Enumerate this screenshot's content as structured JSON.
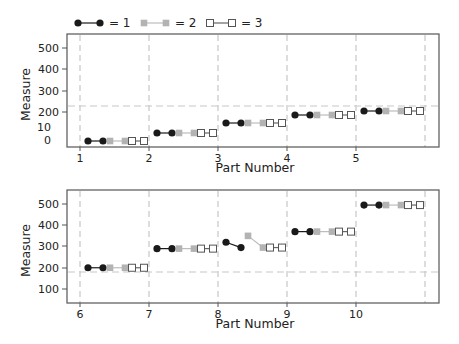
{
  "chart_data": {
    "type": "line",
    "title": "",
    "legend": {
      "position": "top-left",
      "entries": [
        {
          "label": "= 1",
          "marker": "filled-circle",
          "color": "#1a1a1a"
        },
        {
          "label": "= 2",
          "marker": "filled-square",
          "color": "#b3b3b3"
        },
        {
          "label": "= 3",
          "marker": "open-square",
          "color": "#555555"
        }
      ]
    },
    "panels": [
      {
        "xlabel": "Part Number",
        "ylabel": "Measure",
        "x_ticks": [
          "1",
          "2",
          "3",
          "4",
          "5"
        ],
        "y_ticks": [
          "0",
          "10",
          "200",
          "300",
          "400",
          "500"
        ],
        "reference_line": 225,
        "grid": "vertical dashed",
        "parts": [
          {
            "part": "1",
            "op1": [
              0,
              0
            ],
            "op2": [
              0,
              0
            ],
            "op3": [
              0,
              0
            ]
          },
          {
            "part": "2",
            "op1": [
              40,
              40
            ],
            "op2": [
              40,
              40
            ],
            "op3": [
              40,
              40
            ]
          },
          {
            "part": "3",
            "op1": [
              90,
              90
            ],
            "op2": [
              90,
              90
            ],
            "op3": [
              90,
              90
            ]
          },
          {
            "part": "4",
            "op1": [
              175,
              175
            ],
            "op2": [
              175,
              175
            ],
            "op3": [
              175,
              175
            ]
          },
          {
            "part": "5",
            "op1": [
              200,
              200
            ],
            "op2": [
              200,
              200
            ],
            "op3": [
              200,
              200
            ]
          }
        ]
      },
      {
        "xlabel": "Part Number",
        "ylabel": "Measure",
        "x_ticks": [
          "6",
          "7",
          "8",
          "9",
          "10"
        ],
        "y_ticks": [
          "100",
          "200",
          "300",
          "400",
          "500"
        ],
        "reference_line": 185,
        "grid": "vertical dashed",
        "parts": [
          {
            "part": "6",
            "op1": [
              200,
              200
            ],
            "op2": [
              200,
              200
            ],
            "op3": [
              200,
              200
            ]
          },
          {
            "part": "7",
            "op1": [
              290,
              290
            ],
            "op2": [
              290,
              290
            ],
            "op3": [
              290,
              290
            ]
          },
          {
            "part": "8",
            "op1": [
              320,
              295
            ],
            "op2": [
              350,
              295
            ],
            "op3": [
              295,
              295
            ]
          },
          {
            "part": "9",
            "op1": [
              370,
              370
            ],
            "op2": [
              370,
              370
            ],
            "op3": [
              370,
              370
            ]
          },
          {
            "part": "10",
            "op1": [
              495,
              495
            ],
            "op2": [
              495,
              495
            ],
            "op3": [
              495,
              495
            ]
          }
        ]
      }
    ]
  },
  "layout": {
    "panels": [
      {
        "frame": {
          "x0": 67,
          "y0": 34,
          "x1": 439,
          "y1": 147
        },
        "grid_x": [
          80,
          149,
          218,
          287,
          356,
          425
        ],
        "y_tick_pos": [
          {
            "label": "500",
            "y": 48,
            "tick": true
          },
          {
            "label": "400",
            "y": 69,
            "tick": true
          },
          {
            "label": "300",
            "y": 91,
            "tick": true
          },
          {
            "label": "200",
            "y": 112,
            "tick": true
          },
          {
            "label": "10",
            "y": 127,
            "tick": false
          },
          {
            "label": "0",
            "y": 140,
            "tick": false
          }
        ],
        "ref_y": 106,
        "data_y": [
          141,
          133,
          123,
          115,
          111
        ],
        "xlabel_y": 172
      },
      {
        "frame": {
          "x0": 67,
          "y0": 190,
          "x1": 439,
          "y1": 303
        },
        "grid_x": [
          80,
          149,
          218,
          287,
          356,
          425
        ],
        "y_tick_pos": [
          {
            "label": "500",
            "y": 204,
            "tick": true
          },
          {
            "label": "400",
            "y": 225,
            "tick": true
          },
          {
            "label": "300",
            "y": 246,
            "tick": true
          },
          {
            "label": "200",
            "y": 268,
            "tick": true
          },
          {
            "label": "100",
            "y": 289,
            "tick": true
          }
        ],
        "ref_y": 272,
        "yscale": {
          "v0": 100,
          "y0": 289,
          "v1": 500,
          "y1": 204
        },
        "xlabel_y": 328
      }
    ],
    "legend": {
      "y": 23,
      "x": 78
    }
  }
}
